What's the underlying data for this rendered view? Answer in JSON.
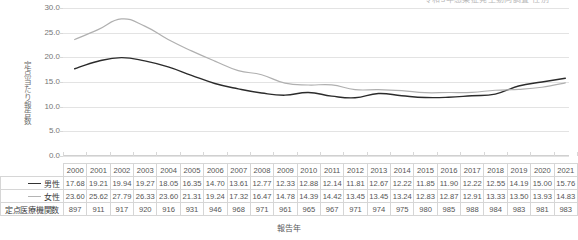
{
  "top_fragment": {
    "text": "令和3年感染症発生動向調査   性別"
  },
  "chart_data": {
    "type": "line",
    "title": "",
    "xlabel": "報告年",
    "ylabel": "定点当たり報告数",
    "ylim": [
      0.0,
      30.0
    ],
    "yticks": [
      "0.0",
      "5.0",
      "10.0",
      "15.0",
      "20.0",
      "25.0",
      "30.0"
    ],
    "ytick_values": [
      0.0,
      5.0,
      10.0,
      15.0,
      20.0,
      25.0,
      30.0
    ],
    "grid": true,
    "legend_position": "none",
    "categories": [
      "2000",
      "2001",
      "2002",
      "2003",
      "2004",
      "2005",
      "2006",
      "2007",
      "2008",
      "2009",
      "2010",
      "2011",
      "2012",
      "2013",
      "2014",
      "2015",
      "2016",
      "2017",
      "2018",
      "2019",
      "2020",
      "2021"
    ],
    "series": [
      {
        "name": "男性",
        "color": "#2b2b2b",
        "values": [
          17.68,
          19.21,
          19.94,
          19.27,
          18.05,
          16.35,
          14.7,
          13.61,
          12.77,
          12.33,
          12.88,
          12.14,
          11.81,
          12.67,
          12.22,
          11.85,
          11.9,
          12.22,
          12.55,
          14.19,
          15.0,
          15.76
        ]
      },
      {
        "name": "女性",
        "color": "#b0b0b0",
        "values": [
          23.6,
          25.62,
          27.79,
          26.33,
          23.6,
          21.31,
          19.24,
          17.32,
          16.47,
          14.78,
          14.39,
          14.42,
          13.45,
          13.45,
          13.24,
          12.83,
          12.87,
          12.91,
          13.33,
          13.5,
          13.93,
          14.83
        ]
      }
    ]
  },
  "table": {
    "header_corner": "",
    "years": [
      "2000",
      "2001",
      "2002",
      "2003",
      "2004",
      "2005",
      "2006",
      "2007",
      "2008",
      "2009",
      "2010",
      "2011",
      "2012",
      "2013",
      "2014",
      "2015",
      "2016",
      "2017",
      "2018",
      "2019",
      "2020",
      "2021"
    ],
    "rows": [
      {
        "label": "男性",
        "marker": "solid-dark",
        "values": [
          "17.68",
          "19.21",
          "19.94",
          "19.27",
          "18.05",
          "16.35",
          "14.70",
          "13.61",
          "12.77",
          "12.33",
          "12.88",
          "12.14",
          "11.81",
          "12.67",
          "12.22",
          "11.85",
          "11.90",
          "12.22",
          "12.55",
          "14.19",
          "15.00",
          "15.76"
        ]
      },
      {
        "label": "女性",
        "marker": "solid-light",
        "values": [
          "23.60",
          "25.62",
          "27.79",
          "26.33",
          "23.60",
          "21.31",
          "19.24",
          "17.32",
          "16.47",
          "14.78",
          "14.39",
          "14.42",
          "13.45",
          "13.45",
          "13.24",
          "12.83",
          "12.87",
          "12.91",
          "13.33",
          "13.50",
          "13.93",
          "14.83"
        ]
      },
      {
        "label": "定点医療機関数",
        "marker": "none",
        "values": [
          "897",
          "911",
          "917",
          "920",
          "916",
          "931",
          "946",
          "968",
          "971",
          "961",
          "965",
          "967",
          "971",
          "974",
          "975",
          "980",
          "985",
          "988",
          "984",
          "983",
          "981",
          "983"
        ]
      }
    ]
  }
}
